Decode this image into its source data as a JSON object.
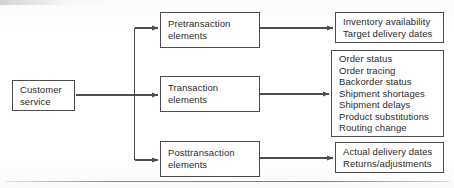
{
  "figure": {
    "type": "flow-diagram",
    "orientation": "left-to-right",
    "source": {
      "id": "customer-service",
      "lines": [
        "Customer",
        "service"
      ]
    },
    "branches": [
      {
        "id": "pretransaction",
        "lines": [
          "Pretransaction",
          "elements"
        ],
        "items": [
          "Inventory availability",
          "Target delivery dates"
        ]
      },
      {
        "id": "transaction",
        "lines": [
          "Transaction",
          "elements"
        ],
        "items": [
          "Order status",
          "Order tracing",
          "Backorder status",
          "Shipment shortages",
          "Shipment delays",
          "Product substitutions",
          "Routing change"
        ]
      },
      {
        "id": "posttransaction",
        "lines": [
          "Posttransaction",
          "elements"
        ],
        "items": [
          "Actual delivery dates",
          "Returns/adjustments"
        ]
      }
    ],
    "style": {
      "line_color": "#4c4c4c",
      "text_color": "#2b2b2b",
      "background": "#fdfdfd",
      "rule_color": "#7a7a7a"
    }
  }
}
